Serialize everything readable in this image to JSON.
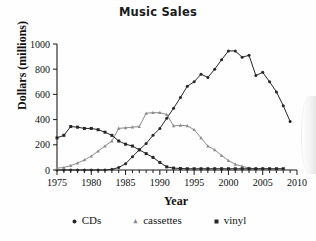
{
  "chart_data": {
    "type": "line",
    "title": "Music Sales",
    "xlabel": "Year",
    "ylabel": "Dollars (millions)",
    "xlim": [
      1975,
      2010
    ],
    "ylim": [
      0,
      1000
    ],
    "xticks": [
      1975,
      1980,
      1985,
      1990,
      1995,
      2000,
      2005,
      2010
    ],
    "yticks": [
      0,
      200,
      400,
      600,
      800,
      1000
    ],
    "grid": false,
    "legend_position": "bottom",
    "x": [
      1975,
      1976,
      1977,
      1978,
      1979,
      1980,
      1981,
      1982,
      1983,
      1984,
      1985,
      1986,
      1987,
      1988,
      1989,
      1990,
      1991,
      1992,
      1993,
      1994,
      1995,
      1996,
      1997,
      1998,
      1999,
      2000,
      2001,
      2002,
      2003,
      2004,
      2005,
      2006,
      2007,
      2008
    ],
    "series": [
      {
        "name": "CDs",
        "marker": "circle",
        "color": "#262626",
        "values": [
          0,
          0,
          0,
          0,
          0,
          0,
          0,
          0,
          5,
          20,
          50,
          105,
          160,
          210,
          275,
          330,
          410,
          490,
          575,
          665,
          700,
          760,
          735,
          800,
          875,
          945,
          945,
          895,
          910,
          750,
          775,
          700,
          620,
          510
        ]
      },
      {
        "name": "cassettes",
        "marker": "triangle",
        "color": "#8c8c8c",
        "values": [
          15,
          20,
          35,
          55,
          80,
          110,
          150,
          190,
          230,
          330,
          335,
          340,
          345,
          450,
          455,
          455,
          440,
          350,
          355,
          350,
          320,
          255,
          190,
          160,
          115,
          75,
          45,
          30,
          15,
          10,
          8,
          6,
          5,
          5
        ]
      },
      {
        "name": "vinyl",
        "marker": "square",
        "color": "#262626",
        "values": [
          255,
          275,
          345,
          340,
          330,
          330,
          320,
          300,
          275,
          230,
          205,
          190,
          160,
          130,
          100,
          60,
          25,
          15,
          12,
          10,
          10,
          10,
          10,
          10,
          10,
          10,
          10,
          10,
          10,
          10,
          10,
          10,
          10,
          10
        ]
      }
    ],
    "last_point_cds": 385
  },
  "legend": {
    "items": [
      {
        "label": "CDs",
        "marker": "circle-marker-icon"
      },
      {
        "label": "cassettes",
        "marker": "triangle-marker-icon"
      },
      {
        "label": "vinyl",
        "marker": "square-marker-icon"
      }
    ]
  }
}
